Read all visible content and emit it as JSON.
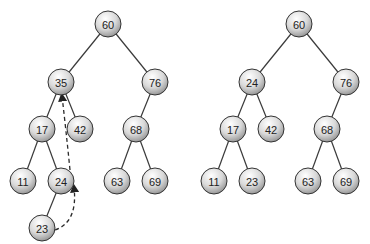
{
  "diagram": {
    "type": "binary-search-tree-deletion",
    "node_radius": 13,
    "colors": {
      "edge": "#3a3a3a",
      "node_fill_light": "#f4f4f4",
      "node_fill_dark": "#9a9a9a",
      "text": "#222222"
    },
    "trees": [
      {
        "id": "before",
        "nodes": [
          {
            "id": "a60",
            "label": "60",
            "x": 108,
            "y": 24
          },
          {
            "id": "a35",
            "label": "35",
            "x": 61,
            "y": 82
          },
          {
            "id": "a76",
            "label": "76",
            "x": 155,
            "y": 82
          },
          {
            "id": "a17",
            "label": "17",
            "x": 42,
            "y": 129
          },
          {
            "id": "a42",
            "label": "42",
            "x": 80,
            "y": 129
          },
          {
            "id": "a68",
            "label": "68",
            "x": 136,
            "y": 129
          },
          {
            "id": "a11",
            "label": "11",
            "x": 23,
            "y": 181
          },
          {
            "id": "a24",
            "label": "24",
            "x": 61,
            "y": 181
          },
          {
            "id": "a63",
            "label": "63",
            "x": 117,
            "y": 181
          },
          {
            "id": "a69",
            "label": "69",
            "x": 155,
            "y": 181
          },
          {
            "id": "a23",
            "label": "23",
            "x": 42,
            "y": 228
          }
        ],
        "edges": [
          [
            "a60",
            "a35"
          ],
          [
            "a60",
            "a76"
          ],
          [
            "a35",
            "a17"
          ],
          [
            "a35",
            "a42"
          ],
          [
            "a76",
            "a68"
          ],
          [
            "a17",
            "a11"
          ],
          [
            "a17",
            "a24"
          ],
          [
            "a68",
            "a63"
          ],
          [
            "a68",
            "a69"
          ],
          [
            "a24",
            "a23"
          ]
        ],
        "dashed_arrows": [
          {
            "from": "a23",
            "to": "a24",
            "path": "M 55 230 Q 78 222 74 187"
          },
          {
            "from": "a24",
            "to": "a35",
            "path": "M 70 170 Q 66 130 62 96"
          }
        ]
      },
      {
        "id": "after",
        "nodes": [
          {
            "id": "b60",
            "label": "60",
            "x": 299,
            "y": 24
          },
          {
            "id": "b24",
            "label": "24",
            "x": 252,
            "y": 82
          },
          {
            "id": "b76",
            "label": "76",
            "x": 346,
            "y": 82
          },
          {
            "id": "b17",
            "label": "17",
            "x": 233,
            "y": 129
          },
          {
            "id": "b42",
            "label": "42",
            "x": 271,
            "y": 129
          },
          {
            "id": "b68",
            "label": "68",
            "x": 327,
            "y": 129
          },
          {
            "id": "b11",
            "label": "11",
            "x": 214,
            "y": 181
          },
          {
            "id": "b23",
            "label": "23",
            "x": 252,
            "y": 181
          },
          {
            "id": "b63",
            "label": "63",
            "x": 308,
            "y": 181
          },
          {
            "id": "b69",
            "label": "69",
            "x": 346,
            "y": 181
          }
        ],
        "edges": [
          [
            "b60",
            "b24"
          ],
          [
            "b60",
            "b76"
          ],
          [
            "b24",
            "b17"
          ],
          [
            "b24",
            "b42"
          ],
          [
            "b76",
            "b68"
          ],
          [
            "b17",
            "b11"
          ],
          [
            "b17",
            "b23"
          ],
          [
            "b68",
            "b63"
          ],
          [
            "b68",
            "b69"
          ]
        ],
        "dashed_arrows": []
      }
    ]
  }
}
